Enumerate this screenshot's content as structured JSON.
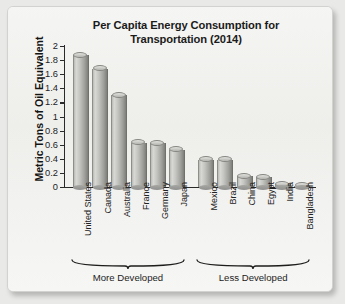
{
  "card": {
    "background_color": "#f3f3f1",
    "border_color": "#d2d2cf"
  },
  "chart_data": {
    "type": "bar",
    "title": "Per Capita Energy Consumption for Transportation (2014)",
    "title_line1": "Per Capita Energy Consumption for",
    "title_line2": "Transportation (2014)",
    "xlabel": "",
    "ylabel": "Metric Tons of Oil Equivalent",
    "ylim": [
      0,
      2
    ],
    "ytick_labels": [
      "0",
      "0.2",
      "0.4",
      "0.6",
      "0.8",
      "1",
      "1.2",
      "1.4",
      "1.6",
      "1.8",
      "2"
    ],
    "ytick_values": [
      0,
      0.2,
      0.4,
      0.6,
      0.8,
      1,
      1.2,
      1.4,
      1.6,
      1.8,
      2
    ],
    "grid": false,
    "legend": false,
    "bar_color": "#bdbdb9",
    "categories": [
      "United States",
      "Canada",
      "Australia",
      "France",
      "Germany",
      "Japan",
      "Mexico",
      "Brazil",
      "China",
      "Egypt",
      "India",
      "Bangladesh"
    ],
    "values": [
      1.87,
      1.68,
      1.3,
      0.63,
      0.62,
      0.53,
      0.39,
      0.39,
      0.15,
      0.14,
      0.04,
      0.01
    ],
    "groups": [
      {
        "label": "More Developed",
        "start_index": 0,
        "end_index": 5
      },
      {
        "label": "Less Developed",
        "start_index": 6,
        "end_index": 11
      }
    ]
  }
}
